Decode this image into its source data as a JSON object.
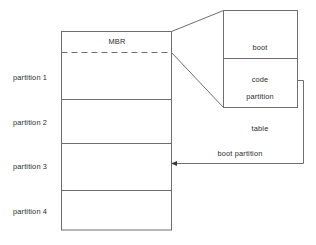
{
  "diagram": {
    "type": "block-diagram",
    "colors": {
      "stroke": "#6e6e6e",
      "text": "#2b2b2b",
      "background": "#ffffff"
    },
    "disk": {
      "name": "disk-layout-column",
      "mbr_label": "MBR",
      "partitions": [
        {
          "label": "partition 1"
        },
        {
          "label": "partition 2"
        },
        {
          "label": "partition 3"
        },
        {
          "label": "partition 4"
        }
      ]
    },
    "callout": {
      "name": "mbr-detail-callout",
      "sections": [
        {
          "line1": "boot",
          "line2": "code"
        },
        {
          "line1": "partition",
          "line2": "table"
        }
      ]
    },
    "connector": {
      "label": "boot partition",
      "from": "partition table",
      "to": "partition 3",
      "arrow": "left"
    }
  }
}
